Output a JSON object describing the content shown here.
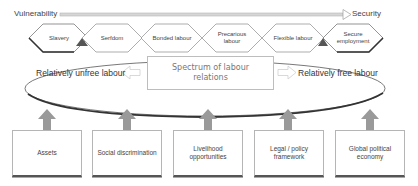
{
  "axis": {
    "left_label": "Vulnerability",
    "right_label": "Security"
  },
  "spectrum": {
    "hexagons": [
      {
        "label": "Slavery"
      },
      {
        "label": "Serfdom"
      },
      {
        "label": "Bonded labour"
      },
      {
        "label": "Precarious labour"
      },
      {
        "label": "Flexible labour"
      },
      {
        "label": "Secure employment"
      }
    ]
  },
  "ellipse": {
    "left_label": "Relatively unfree labour",
    "center_label": "Spectrum of labour relations",
    "right_label": "Relatively free labour"
  },
  "factors": [
    {
      "label": "Assets"
    },
    {
      "label": "Social discrimination"
    },
    {
      "label": "Livelihood opportunities"
    },
    {
      "label": "Legal / policy framework"
    },
    {
      "label": "Global political economy"
    }
  ],
  "colors": {
    "line": "#333333",
    "arrow_fill": "#9a9a9a",
    "axis_arrow": "#c8c8c8",
    "box_border": "#b5b5b5"
  }
}
